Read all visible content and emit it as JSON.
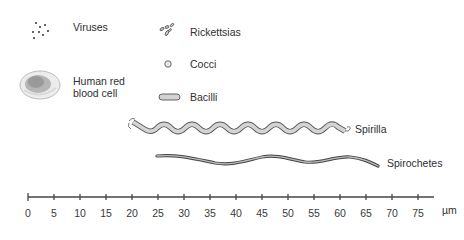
{
  "diagram": {
    "organisms": [
      {
        "id": "viruses",
        "label": "Viruses",
        "icon": "virus-dots-icon"
      },
      {
        "id": "rickettsias",
        "label": "Rickettsias",
        "icon": "rickettsia-icon"
      },
      {
        "id": "cocci",
        "label": "Cocci",
        "icon": "coccus-circle-icon"
      },
      {
        "id": "bacilli",
        "label": "Bacilli",
        "icon": "bacillus-rod-icon"
      },
      {
        "id": "rbc",
        "label": "Human red\nblood cell",
        "icon": "red-blood-cell-icon"
      },
      {
        "id": "spirilla",
        "label": "Spirilla",
        "icon": "spirillum-icon"
      },
      {
        "id": "spirochetes",
        "label": "Spirochetes",
        "icon": "spirochete-icon"
      }
    ],
    "scale": {
      "unit": "µm",
      "ticks": [
        "0",
        "5",
        "10",
        "15",
        "20",
        "25",
        "30",
        "35",
        "40",
        "45",
        "50",
        "55",
        "60",
        "65",
        "70",
        "75"
      ],
      "min": 0,
      "max": 75,
      "step": 5
    },
    "colors": {
      "organism_fill": "#cfcfcf",
      "organism_stroke": "#555555",
      "axis": "#444444",
      "rbc_fill": "#e6e6e6",
      "rbc_center": "#9a9a9a"
    }
  }
}
